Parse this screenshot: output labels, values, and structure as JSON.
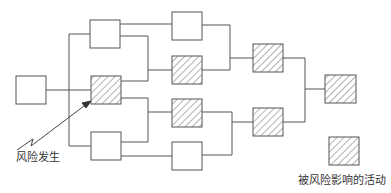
{
  "diagram": {
    "type": "network-diagram",
    "colors": {
      "line": "#555555",
      "hatch": "#666666",
      "background": "#ffffff"
    },
    "nodes": [
      {
        "id": "n0",
        "x": 16,
        "y": 76,
        "w": 30,
        "h": 28,
        "affected": false
      },
      {
        "id": "n1",
        "x": 90,
        "y": 20,
        "w": 30,
        "h": 28,
        "affected": false
      },
      {
        "id": "n2",
        "x": 91,
        "y": 76,
        "w": 30,
        "h": 28,
        "affected": true
      },
      {
        "id": "n3",
        "x": 91,
        "y": 132,
        "w": 30,
        "h": 28,
        "affected": false
      },
      {
        "id": "n4",
        "x": 172,
        "y": 12,
        "w": 30,
        "h": 28,
        "affected": false
      },
      {
        "id": "n5",
        "x": 172,
        "y": 56,
        "w": 30,
        "h": 28,
        "affected": true
      },
      {
        "id": "n6",
        "x": 172,
        "y": 99,
        "w": 30,
        "h": 28,
        "affected": true
      },
      {
        "id": "n7",
        "x": 172,
        "y": 142,
        "w": 30,
        "h": 28,
        "affected": false
      },
      {
        "id": "n8",
        "x": 253,
        "y": 44,
        "w": 30,
        "h": 28,
        "affected": true
      },
      {
        "id": "n9",
        "x": 253,
        "y": 108,
        "w": 30,
        "h": 28,
        "affected": true
      },
      {
        "id": "n10",
        "x": 325,
        "y": 75,
        "w": 31,
        "h": 28,
        "affected": true
      }
    ],
    "risk_label": "风险发生",
    "legend": {
      "label": "被风险影响的活动",
      "box": {
        "x": 329,
        "y": 137,
        "w": 30,
        "h": 28
      }
    }
  }
}
